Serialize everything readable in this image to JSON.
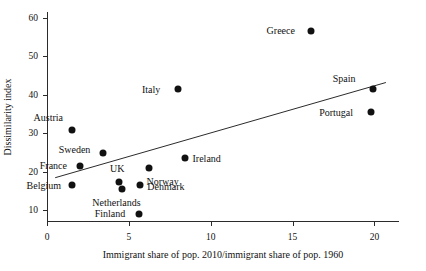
{
  "chart_data": {
    "type": "scatter",
    "title": "",
    "xlabel": "Immigrant share of pop. 2010/immigrant share of pop. 1960",
    "ylabel": "Dissimilarity index",
    "xlim": [
      0,
      21.5
    ],
    "ylim": [
      7,
      61.5
    ],
    "xticks": [
      0,
      5,
      10,
      15,
      20
    ],
    "yticks": [
      10,
      20,
      30,
      40,
      50,
      60
    ],
    "grid": false,
    "legend": "none",
    "points": [
      {
        "label": "Austria",
        "x": 1.5,
        "y": 31.0,
        "label_dx": -38,
        "label_dy": -12
      },
      {
        "label": "France",
        "x": 2.0,
        "y": 21.5,
        "label_dx": -40,
        "label_dy": 0
      },
      {
        "label": "Belgium",
        "x": 1.5,
        "y": 16.5,
        "label_dx": -45,
        "label_dy": 1
      },
      {
        "label": "Sweden",
        "x": 3.4,
        "y": 25.0,
        "label_dx": -44,
        "label_dy": -3
      },
      {
        "label": "UK",
        "x": 4.4,
        "y": 17.5,
        "label_dx": -9,
        "label_dy": -13
      },
      {
        "label": "Netherlands",
        "x": 4.6,
        "y": 15.5,
        "label_dx": -30,
        "label_dy": 14
      },
      {
        "label": "Denmark",
        "x": 5.7,
        "y": 16.5,
        "label_dx": 7,
        "label_dy": 2
      },
      {
        "label": "Finland",
        "x": 5.6,
        "y": 9.0,
        "label_dx": -44,
        "label_dy": 0
      },
      {
        "label": "Norway",
        "x": 6.2,
        "y": 21.0,
        "label_dx": -2,
        "label_dy": 14
      },
      {
        "label": "Italy",
        "x": 8.0,
        "y": 41.5,
        "label_dx": -36,
        "label_dy": 1
      },
      {
        "label": "Ireland",
        "x": 8.4,
        "y": 23.5,
        "label_dx": 8,
        "label_dy": 1
      },
      {
        "label": "Greece",
        "x": 16.1,
        "y": 56.5,
        "label_dx": -44,
        "label_dy": 0
      },
      {
        "label": "Spain",
        "x": 19.9,
        "y": 41.5,
        "label_dx": -40,
        "label_dy": -10
      },
      {
        "label": "Portugal",
        "x": 19.8,
        "y": 35.5,
        "label_dx": -52,
        "label_dy": 1
      }
    ],
    "trend": {
      "x0": 0.5,
      "y0": 18.5,
      "x1": 20.7,
      "y1": 43.2
    }
  }
}
